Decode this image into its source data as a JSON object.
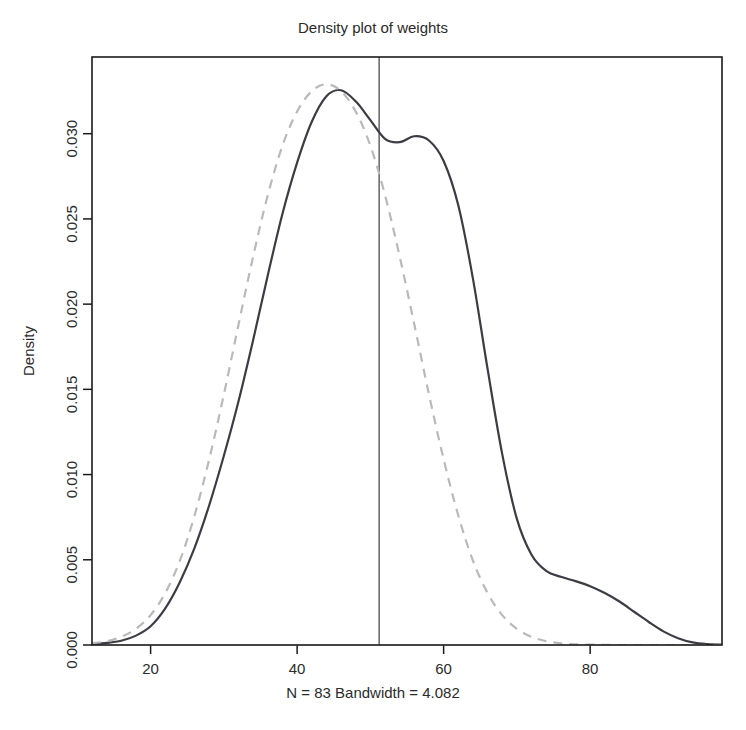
{
  "chart_data": {
    "type": "line",
    "title": "Density plot of weights",
    "xlabel": "N = 83   Bandwidth = 4.082",
    "ylabel": "Density",
    "xlim": [
      12,
      98
    ],
    "ylim": [
      0.0,
      0.0345
    ],
    "grid": false,
    "legend": "none",
    "xticks": [
      20,
      40,
      60,
      80
    ],
    "xtick_labels": [
      "20",
      "40",
      "60",
      "80"
    ],
    "yticks": [
      0.0,
      0.005,
      0.01,
      0.015,
      0.02,
      0.025,
      0.03
    ],
    "ytick_labels": [
      "0.000",
      "0.005",
      "0.010",
      "0.015",
      "0.020",
      "0.025",
      "0.030"
    ],
    "annotations": {
      "sample_size": "N = 83",
      "bandwidth": "Bandwidth = 4.082",
      "mean_line_x": 51.2
    },
    "series": [
      {
        "name": "kernel-density-estimate",
        "style": "solid",
        "color": "#3c3c45",
        "x": [
          12,
          14,
          16,
          18,
          20,
          22,
          24,
          26,
          28,
          30,
          32,
          34,
          36,
          38,
          40,
          42,
          44,
          46,
          48,
          50,
          52,
          54,
          56,
          58,
          60,
          62,
          64,
          66,
          68,
          70,
          72,
          74,
          76,
          78,
          80,
          82,
          84,
          86,
          88,
          90,
          92,
          94,
          96,
          98
        ],
        "y": [
          6e-05,
          0.00012,
          0.00025,
          0.00055,
          0.0011,
          0.00215,
          0.0037,
          0.0057,
          0.0082,
          0.0111,
          0.0143,
          0.0179,
          0.0217,
          0.0253,
          0.0283,
          0.0307,
          0.0322,
          0.03255,
          0.0319,
          0.0308,
          0.0297,
          0.0295,
          0.02985,
          0.0296,
          0.0284,
          0.0258,
          0.0215,
          0.0162,
          0.0112,
          0.0074,
          0.0053,
          0.00435,
          0.004,
          0.00375,
          0.00345,
          0.00305,
          0.00255,
          0.00195,
          0.00135,
          0.0008,
          0.0004,
          0.00015,
          5e-05,
          2e-05
        ]
      },
      {
        "name": "normal-reference-curve",
        "style": "dashed",
        "color": "#b9b9bb",
        "x": [
          12,
          14,
          16,
          18,
          20,
          22,
          24,
          26,
          28,
          30,
          32,
          34,
          36,
          38,
          40,
          42,
          44,
          46,
          48,
          50,
          52,
          54,
          56,
          58,
          60,
          62,
          64,
          66,
          68,
          70,
          72,
          74,
          76,
          78,
          80,
          82,
          84,
          86,
          88,
          90,
          92,
          94,
          96,
          98
        ],
        "y": [
          0.0001,
          0.00022,
          0.00048,
          0.00095,
          0.00175,
          0.00305,
          0.00495,
          0.0076,
          0.0109,
          0.0147,
          0.0188,
          0.0228,
          0.0264,
          0.0293,
          0.0313,
          0.0325,
          0.0329,
          0.0325,
          0.0313,
          0.0293,
          0.0264,
          0.0228,
          0.0188,
          0.0147,
          0.0109,
          0.0076,
          0.00495,
          0.00305,
          0.00175,
          0.00095,
          0.00048,
          0.00022,
          0.0001,
          4e-05,
          2e-05,
          1e-05,
          0.0,
          0.0,
          0.0,
          0.0,
          0.0,
          0.0,
          0.0,
          0.0
        ]
      }
    ],
    "reference_lines": [
      {
        "name": "mean-vertical-line",
        "orientation": "vertical",
        "value": 51.2,
        "color": "#6d6d73"
      },
      {
        "name": "zero-baseline",
        "orientation": "horizontal",
        "value": 0.0,
        "color": "#dcdcdc"
      }
    ]
  }
}
